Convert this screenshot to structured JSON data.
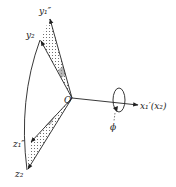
{
  "diagram": {
    "type": "rotation-axes-diagram",
    "colors": {
      "stroke": "#222222",
      "fill_dots": "#555555",
      "background": "#ffffff"
    },
    "labels": {
      "origin": "O",
      "y1pp": "y₁″",
      "y2": "y₂",
      "z1pp": "z₁″",
      "z2": "z₂",
      "x_axis": "x₁′(x₂)",
      "phi": "ϕ"
    },
    "nodes": [
      {
        "id": "O",
        "label": "O",
        "x": 72,
        "y": 98
      },
      {
        "id": "y1pp",
        "label": "y1''",
        "x": 50,
        "y": 18
      },
      {
        "id": "y2",
        "label": "y2",
        "x": 40,
        "y": 40
      },
      {
        "id": "z1pp",
        "label": "z1''",
        "x": 30,
        "y": 143
      },
      {
        "id": "z2",
        "label": "z2",
        "x": 27,
        "y": 170
      },
      {
        "id": "x_tip",
        "label": "x1'(x2)",
        "x": 138,
        "y": 105
      }
    ],
    "edges": [
      {
        "from": "O",
        "to": "y1pp",
        "style": "arrow"
      },
      {
        "from": "O",
        "to": "y2",
        "style": "arrow"
      },
      {
        "from": "O",
        "to": "z1pp",
        "style": "arrow"
      },
      {
        "from": "O",
        "to": "z2",
        "style": "arrow"
      },
      {
        "from": "O",
        "to": "x_tip",
        "style": "arrow"
      },
      {
        "from": "y2",
        "to": "z2",
        "style": "arc"
      }
    ],
    "regions": [
      {
        "name": "upper-wedge",
        "between": [
          "y1pp",
          "y2"
        ],
        "fill": "dotted"
      },
      {
        "name": "lower-wedge",
        "between": [
          "z1pp",
          "z2"
        ],
        "fill": "dotted"
      }
    ],
    "rotation": {
      "axis": "x1'(x2)",
      "angle_label": "phi"
    }
  }
}
